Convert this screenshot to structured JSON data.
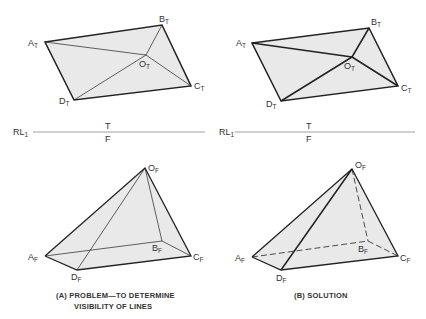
{
  "panels": [
    {
      "id": "A",
      "caption_line1": "(A) PROBLEM—TO DETERMINE",
      "caption_line2": "VISIBILITY OF LINES",
      "top_view": {
        "points": {
          "A": [
            45,
            42
          ],
          "B": [
            162,
            25
          ],
          "O": [
            146,
            55
          ],
          "C": [
            191,
            86
          ],
          "D": [
            74,
            100
          ]
        },
        "labels": {
          "A": "A",
          "B": "B",
          "O": "O",
          "C": "C",
          "D": "D",
          "subscript": "T"
        }
      },
      "reference_line": {
        "label": "RL",
        "label_sub": "1",
        "above": "T",
        "below": "F"
      },
      "front_view": {
        "points": {
          "O": [
            145,
            168
          ],
          "A": [
            45,
            256
          ],
          "B": [
            162,
            241
          ],
          "C": [
            191,
            256
          ],
          "D": [
            77,
            270
          ]
        },
        "subscript": "F"
      }
    },
    {
      "id": "B",
      "caption_line1": "(B) SOLUTION",
      "top_view": {
        "points": {
          "A": [
            252,
            43
          ],
          "B": [
            369,
            28
          ],
          "O": [
            352,
            57
          ],
          "C": [
            398,
            86
          ],
          "D": [
            281,
            101
          ]
        },
        "subscript": "T"
      },
      "reference_line": {
        "label": "RL",
        "label_sub": "1",
        "above": "T",
        "below": "F"
      },
      "front_view": {
        "points": {
          "O": [
            352,
            169
          ],
          "A": [
            252,
            257
          ],
          "B": [
            368,
            241
          ],
          "C": [
            398,
            256
          ],
          "D": [
            281,
            270
          ]
        },
        "subscript": "F",
        "hidden_lines": [
          "O-B",
          "A-B",
          "B-C"
        ]
      }
    }
  ],
  "colors": {
    "line": "#222222",
    "fill": "#e9e9e9",
    "refline": "#888888",
    "text": "#333333"
  }
}
